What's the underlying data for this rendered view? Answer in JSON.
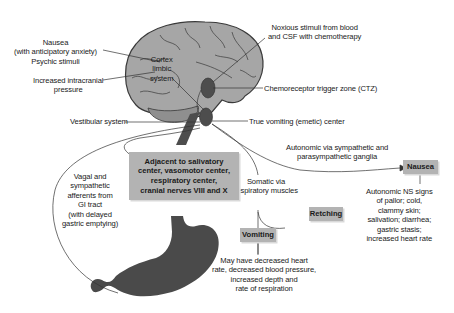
{
  "diagram": {
    "title": "",
    "colors": {
      "brain": "#a6a6a6",
      "brain_outline": "#3a3a3a",
      "nucleus": "#4d4d4d",
      "stomach": "#4a4a4a",
      "box_fill": "#b3b3b3",
      "line": "#333333"
    },
    "brain_labels": {
      "cortex": [
        "Cortex",
        "limbic",
        "system"
      ]
    },
    "left_labels": {
      "nausea": [
        "Nausea",
        "(with anticipatory anxiety)",
        "Psychic stimuli"
      ],
      "intracranial": [
        "Increased intracranial",
        "pressure"
      ],
      "vestibular": "Vestibular system",
      "vagal": [
        "Vagal and",
        "sympathetic",
        "afferents from",
        "GI tract",
        "(with delayed",
        "gastric emptying)"
      ]
    },
    "right_labels": {
      "noxious": [
        "Noxious stimuli from blood",
        "and CSF with chemotherapy"
      ],
      "ctz": "Chemoreceptor trigger zone (CTZ)",
      "vomiting_center": "True vomiting (emetic) center",
      "autonomic": [
        "Autonomic via sympathetic and",
        "parasympathetic ganglia"
      ],
      "somatic": [
        "Somatic via",
        "respiratory muscles"
      ]
    },
    "boxes": {
      "adjacent": [
        "Adjacent to salivatory",
        "center, vasomotor center,",
        "respiratory center,",
        "cranial nerves VIII and X"
      ],
      "nausea": "Nausea",
      "retching": "Retching",
      "vomiting": "Vomiting"
    },
    "outcomes": {
      "nausea_signs": [
        "Autonomic NS signs",
        "of pallor; cold,",
        "clammy skin;",
        "salivation; diarrhea;",
        "gastric stasis;",
        "increased heart rate"
      ],
      "vomiting_signs": [
        "May have decreased heart",
        "rate, decreased blood pressure,",
        "increased depth and",
        "rate of respiration"
      ]
    }
  }
}
